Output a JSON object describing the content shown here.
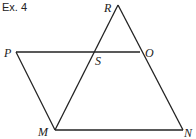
{
  "title": "Ex. 4",
  "points": {
    "R": {
      "label": "R",
      "x": 118,
      "y": 5
    },
    "P": {
      "label": "P",
      "x": 16,
      "y": 52
    },
    "O": {
      "label": "O",
      "x": 140,
      "y": 52
    },
    "S": {
      "label": "S",
      "x": 93,
      "y": 52
    },
    "M": {
      "label": "M",
      "x": 55,
      "y": 130
    },
    "N": {
      "label": "N",
      "x": 183,
      "y": 130
    }
  },
  "segments": [
    [
      "P",
      "O"
    ],
    [
      "P",
      "M"
    ],
    [
      "M",
      "N"
    ],
    [
      "N",
      "R"
    ],
    [
      "M",
      "R"
    ]
  ],
  "stroke_color": "#222222"
}
